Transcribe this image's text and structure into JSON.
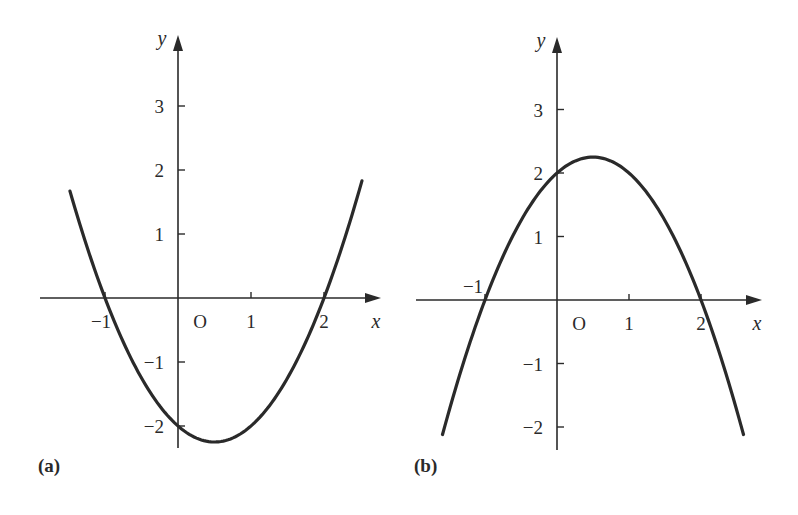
{
  "chart_data": [
    {
      "id": "a",
      "type": "line",
      "panel_label": "(a)",
      "title": "",
      "function": "y = x^2 - x - 2",
      "xlabel": "x",
      "ylabel": "y",
      "origin_label": "O",
      "xlim": [
        -1.5,
        2.5
      ],
      "ylim": [
        -2.25,
        3.8
      ],
      "x_ticks": [
        {
          "value": -1,
          "label": "−1"
        },
        {
          "value": 1,
          "label": "1"
        },
        {
          "value": 2,
          "label": "2"
        }
      ],
      "y_ticks": [
        {
          "value": 3,
          "label": "3"
        },
        {
          "value": 2,
          "label": "2"
        },
        {
          "value": 1,
          "label": "1"
        },
        {
          "value": -1,
          "label": "−1"
        },
        {
          "value": -2,
          "label": "−2"
        }
      ],
      "key_points": {
        "roots": [
          -1,
          2
        ],
        "y_intercept": -2,
        "vertex": [
          0.5,
          -2.25
        ]
      },
      "curve_domain": [
        -1.48,
        2.52
      ],
      "grid": false,
      "pixel_map": {
        "x0": 178,
        "y0": 298,
        "ux": 73,
        "uy": 64,
        "x_axis_start": 40,
        "x_axis_end": 381,
        "y_axis_top": 35,
        "y_axis_bottom": 448
      }
    },
    {
      "id": "b",
      "type": "line",
      "panel_label": "(b)",
      "title": "",
      "function": "y = -x^2 + x + 2",
      "xlabel": "x",
      "ylabel": "y",
      "origin_label": "O",
      "xlim": [
        -1.6,
        2.6
      ],
      "ylim": [
        -2.4,
        3.8
      ],
      "x_ticks": [
        {
          "value": -1,
          "label": "−1"
        },
        {
          "value": 1,
          "label": "1"
        },
        {
          "value": 2,
          "label": "2"
        }
      ],
      "y_ticks": [
        {
          "value": 3,
          "label": "3"
        },
        {
          "value": 2,
          "label": "2"
        },
        {
          "value": 1,
          "label": "1"
        },
        {
          "value": -1,
          "label": "−1"
        },
        {
          "value": -2,
          "label": "−2"
        }
      ],
      "key_points": {
        "roots": [
          -1,
          2
        ],
        "y_intercept": 2,
        "vertex": [
          0.5,
          2.25
        ]
      },
      "curve_domain": [
        -1.59,
        2.59
      ],
      "grid": false,
      "pixel_map": {
        "x0": 557,
        "y0": 300,
        "ux": 72,
        "uy": 63.5,
        "x_axis_start": 416,
        "x_axis_end": 762,
        "y_axis_top": 37,
        "y_axis_bottom": 450
      }
    }
  ],
  "colors": {
    "ink": "#2a2a2a",
    "background": "#ffffff"
  }
}
